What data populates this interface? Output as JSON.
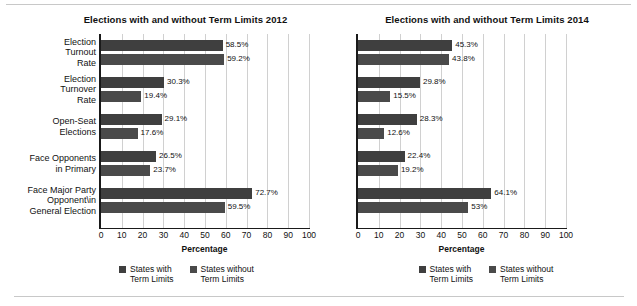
{
  "figure": {
    "background": "#ffffff",
    "bar_color_series1": "#3f3f3f",
    "bar_color_series2": "#4a4a4a",
    "grid_color": "#d0d0d0",
    "axis_color": "#1a1a1a"
  },
  "charts": [
    {
      "id": "chart-2012",
      "title": "Elections with and without Term Limits 2012",
      "xlabel": "Percentage",
      "categories": [
        "Election\nTurnout\nRate",
        "Election\nTurnover\nRate",
        "Open-Seat\nElections",
        "Face Opponents\nin Primary",
        "Face Major Party\nOpponent\\in\nGeneral Election"
      ],
      "ticks": [
        "0",
        "10",
        "20",
        "30",
        "40",
        "50",
        "60",
        "70",
        "80",
        "90",
        "100"
      ],
      "series": [
        {
          "name": "States with\nTerm Limits",
          "values": [
            58.5,
            30.3,
            29.1,
            26.5,
            72.7
          ],
          "labels": [
            "58.5%",
            "30.3%",
            "29.1%",
            "26.5%",
            "72.7%"
          ]
        },
        {
          "name": "States without\nTerm Limits",
          "values": [
            59.2,
            19.4,
            17.6,
            23.7,
            59.5
          ],
          "labels": [
            "59.2%",
            "19.4%",
            "17.6%",
            "23.7%",
            "59.5%"
          ]
        }
      ]
    },
    {
      "id": "chart-2014",
      "title": "Elections with and without Term Limits 2014",
      "xlabel": "Percentage",
      "categories": [
        "",
        "",
        "",
        "",
        ""
      ],
      "ticks": [
        "0",
        "10",
        "20",
        "30",
        "40",
        "50",
        "60",
        "70",
        "80",
        "90",
        "100"
      ],
      "series": [
        {
          "name": "States with\nTerm Limits",
          "values": [
            45.3,
            29.8,
            28.3,
            22.4,
            64.1
          ],
          "labels": [
            "45.3%",
            "29.8%",
            "28.3%",
            "22.4%",
            "64.1%"
          ]
        },
        {
          "name": "States without\nTerm Limits",
          "values": [
            43.8,
            15.5,
            12.6,
            19.2,
            53.0
          ],
          "labels": [
            "43.8%",
            "15.5%",
            "12.6%",
            "19.2%",
            "53%"
          ]
        }
      ]
    }
  ],
  "chart_data": [
    {
      "type": "bar",
      "orientation": "horizontal",
      "title": "Elections with and without Term Limits 2012",
      "xlabel": "Percentage",
      "ylabel": "",
      "xlim": [
        0,
        100
      ],
      "xticks": [
        0,
        10,
        20,
        30,
        40,
        50,
        60,
        70,
        80,
        90,
        100
      ],
      "grid": "vertical",
      "legend_position": "bottom-center",
      "categories": [
        "Election Turnout Rate",
        "Election Turnover Rate",
        "Open-Seat Elections",
        "Face Opponents in Primary",
        "Face Major Party Opponent in General Election"
      ],
      "series": [
        {
          "name": "States with Term Limits",
          "values": [
            58.5,
            30.3,
            29.1,
            26.5,
            72.7
          ]
        },
        {
          "name": "States without Term Limits",
          "values": [
            59.2,
            19.4,
            17.6,
            23.7,
            59.5
          ]
        }
      ],
      "data_labels": [
        [
          "58.5%",
          "30.3%",
          "29.1%",
          "26.5%",
          "72.7%"
        ],
        [
          "59.2%",
          "19.4%",
          "17.6%",
          "23.7%",
          "59.5%"
        ]
      ]
    },
    {
      "type": "bar",
      "orientation": "horizontal",
      "title": "Elections with and without Term Limits 2014",
      "xlabel": "Percentage",
      "ylabel": "",
      "xlim": [
        0,
        100
      ],
      "xticks": [
        0,
        10,
        20,
        30,
        40,
        50,
        60,
        70,
        80,
        90,
        100
      ],
      "grid": "vertical",
      "legend_position": "bottom-center",
      "categories": [
        "Election Turnout Rate",
        "Election Turnover Rate",
        "Open-Seat Elections",
        "Face Opponents in Primary",
        "Face Major Party Opponent in General Election"
      ],
      "series": [
        {
          "name": "States with Term Limits",
          "values": [
            45.3,
            29.8,
            28.3,
            22.4,
            64.1
          ]
        },
        {
          "name": "States without Term Limits",
          "values": [
            43.8,
            15.5,
            12.6,
            19.2,
            53.0
          ]
        }
      ],
      "data_labels": [
        [
          "45.3%",
          "29.8%",
          "28.3%",
          "22.4%",
          "64.1%"
        ],
        [
          "43.8%",
          "15.5%",
          "12.6%",
          "19.2%",
          "53%"
        ]
      ]
    }
  ]
}
